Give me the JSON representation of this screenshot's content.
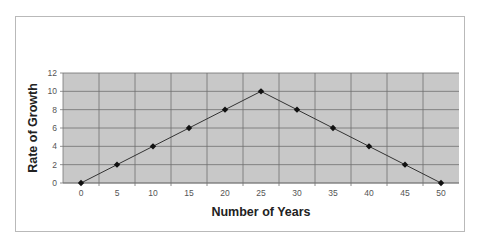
{
  "chart_data": {
    "type": "line",
    "title": "",
    "xlabel": "Number of Years",
    "ylabel": "Rate of Growth",
    "categories": [
      "0",
      "5",
      "10",
      "15",
      "20",
      "25",
      "30",
      "35",
      "40",
      "45",
      "50"
    ],
    "x": [
      0,
      5,
      10,
      15,
      20,
      25,
      30,
      35,
      40,
      45,
      50
    ],
    "values": [
      0,
      2,
      4,
      6,
      8,
      10,
      8,
      6,
      4,
      2,
      0
    ],
    "series": [
      {
        "name": "Rate of Growth",
        "values": [
          0,
          2,
          4,
          6,
          8,
          10,
          8,
          6,
          4,
          2,
          0
        ]
      }
    ],
    "ylim": [
      0,
      12
    ],
    "yticks": [
      0,
      2,
      4,
      6,
      8,
      10,
      12
    ],
    "grid": true,
    "legend": "none",
    "marker": "diamond",
    "colors": {
      "plot_bg": "#c8c8c8",
      "grid": "#6e6e6e",
      "line": "#333333",
      "marker": "#111111",
      "frame": "#b9b9b9"
    }
  }
}
